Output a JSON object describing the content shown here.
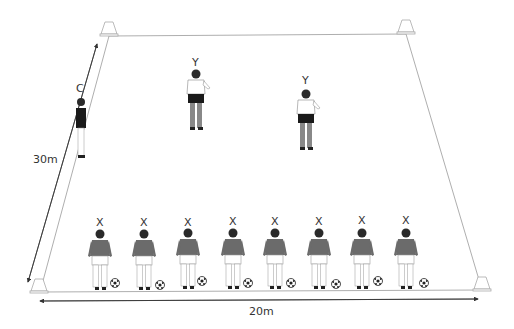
{
  "diagram": {
    "title": "",
    "pitch": {
      "length_label": "30m",
      "width_label": "20m",
      "line_color": "#9a9a9a",
      "cones": [
        {
          "id": "top-left",
          "x": 109,
          "y": 33
        },
        {
          "id": "top-right",
          "x": 406,
          "y": 31
        },
        {
          "id": "bottom-left",
          "x": 35,
          "y": 291
        },
        {
          "id": "bottom-right",
          "x": 482,
          "y": 289
        }
      ]
    },
    "players": {
      "coach": {
        "label": "C",
        "x": 81,
        "y": 127
      },
      "defenders": [
        {
          "label": "Y",
          "x": 196,
          "y": 97
        },
        {
          "label": "Y",
          "x": 308,
          "y": 118
        }
      ],
      "attackers": [
        {
          "label": "X",
          "x": 100
        },
        {
          "label": "X",
          "x": 144
        },
        {
          "label": "X",
          "x": 188
        },
        {
          "label": "X",
          "x": 233
        },
        {
          "label": "X",
          "x": 275
        },
        {
          "label": "X",
          "x": 319
        },
        {
          "label": "X",
          "x": 362
        },
        {
          "label": "X",
          "x": 406
        }
      ]
    },
    "colors": {
      "attacker_shirt": "#6b6b6b",
      "defender_shirt": "#ffffff",
      "coach_shirt": "#1a1a1a",
      "shorts_dark": "#1a1a1a",
      "skin_dark": "#2a2a2a"
    }
  }
}
